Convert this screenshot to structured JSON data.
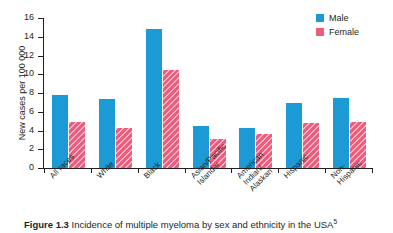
{
  "figure": {
    "caption_label": "Figure 1.3",
    "caption_text": "Incidence of multiple myeloma by sex and ethnicity in the USA",
    "caption_reference": "5"
  },
  "legend": {
    "position": "top-right",
    "items": [
      {
        "label": "Male",
        "color": "#1B9AD6",
        "pattern": "solid"
      },
      {
        "label": "Female",
        "color": "#EE5C7D",
        "pattern": "diagonal-hatch"
      }
    ]
  },
  "chart_data": {
    "type": "bar",
    "title": "",
    "subtitle": "",
    "xlabel": "",
    "ylabel": "New cases per 100 000",
    "ylim": [
      0,
      16
    ],
    "yticks": [
      0,
      2,
      4,
      6,
      8,
      10,
      12,
      14,
      16
    ],
    "ytick_labels": [
      "0",
      "2",
      "4",
      "6",
      "8",
      "10",
      "12",
      "14",
      "16"
    ],
    "grid": false,
    "legend_position": "top-right",
    "categories": [
      "All races",
      "White",
      "Black",
      "Asian/Pacific\nIslander",
      "American\nIndian/\nAlaskan",
      "Hispanic",
      "Non-\nHispanic"
    ],
    "series": [
      {
        "name": "Male",
        "color": "#1B9AD6",
        "values": [
          7.8,
          7.4,
          14.8,
          4.5,
          4.3,
          6.9,
          7.5
        ]
      },
      {
        "name": "Female",
        "color": "#EE5C7D",
        "values": [
          4.9,
          4.3,
          10.5,
          3.1,
          3.6,
          4.8,
          4.9
        ]
      }
    ]
  }
}
